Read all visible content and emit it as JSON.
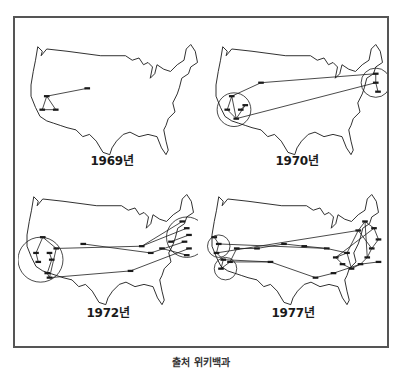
{
  "figure": {
    "frame_color": "#555555",
    "line_color": "#1a1a1a",
    "panels": [
      {
        "year_label": "1969년",
        "circles": [],
        "nodes": [
          [
            22,
            50
          ],
          [
            58,
            43
          ],
          [
            18,
            62
          ],
          [
            30,
            62
          ]
        ],
        "links": [
          [
            0,
            1
          ],
          [
            0,
            2
          ],
          [
            0,
            3
          ],
          [
            2,
            3
          ]
        ]
      },
      {
        "year_label": "1970년",
        "circles": [
          [
            24,
            62,
            15
          ],
          [
            150,
            38,
            13
          ]
        ],
        "nodes": [
          [
            22,
            50
          ],
          [
            48,
            38
          ],
          [
            18,
            62
          ],
          [
            30,
            62
          ],
          [
            26,
            70
          ],
          [
            34,
            58
          ],
          [
            150,
            30
          ],
          [
            150,
            38
          ],
          [
            152,
            46
          ]
        ],
        "links": [
          [
            0,
            2
          ],
          [
            0,
            4
          ],
          [
            2,
            4
          ],
          [
            3,
            5
          ],
          [
            0,
            1
          ],
          [
            1,
            6
          ],
          [
            4,
            7
          ],
          [
            6,
            7
          ],
          [
            7,
            8
          ],
          [
            5,
            4
          ]
        ]
      },
      {
        "year_label": "1972년",
        "circles": [
          [
            20,
            62,
            20
          ],
          [
            150,
            42,
            18
          ]
        ],
        "nodes": [
          [
            22,
            42
          ],
          [
            58,
            48
          ],
          [
            110,
            50
          ],
          [
            118,
            56
          ],
          [
            16,
            56
          ],
          [
            18,
            64
          ],
          [
            28,
            56
          ],
          [
            30,
            62
          ],
          [
            26,
            74
          ],
          [
            28,
            78
          ],
          [
            34,
            52
          ],
          [
            100,
            72
          ],
          [
            146,
            28
          ],
          [
            150,
            34
          ],
          [
            152,
            40
          ],
          [
            148,
            46
          ],
          [
            152,
            52
          ],
          [
            150,
            58
          ],
          [
            136,
            46
          ],
          [
            128,
            52
          ]
        ],
        "links": [
          [
            0,
            10
          ],
          [
            10,
            9
          ],
          [
            10,
            2
          ],
          [
            2,
            13
          ],
          [
            1,
            3
          ],
          [
            3,
            15
          ],
          [
            9,
            11
          ],
          [
            11,
            16
          ],
          [
            2,
            12
          ],
          [
            4,
            5
          ],
          [
            6,
            7
          ],
          [
            7,
            8
          ],
          [
            8,
            9
          ],
          [
            18,
            14
          ],
          [
            19,
            17
          ],
          [
            0,
            4
          ]
        ]
      },
      {
        "year_label": "1977년",
        "circles": [
          [
            14,
            50,
            10
          ],
          [
            20,
            70,
            10
          ]
        ],
        "nodes": [
          [
            10,
            42
          ],
          [
            14,
            48
          ],
          [
            12,
            56
          ],
          [
            18,
            62
          ],
          [
            16,
            70
          ],
          [
            24,
            64
          ],
          [
            30,
            52
          ],
          [
            48,
            52
          ],
          [
            72,
            48
          ],
          [
            90,
            50
          ],
          [
            110,
            52
          ],
          [
            128,
            56
          ],
          [
            138,
            36
          ],
          [
            144,
            28
          ],
          [
            152,
            34
          ],
          [
            156,
            44
          ],
          [
            150,
            52
          ],
          [
            146,
            60
          ],
          [
            140,
            66
          ],
          [
            132,
            70
          ],
          [
            124,
            66
          ],
          [
            118,
            60
          ],
          [
            116,
            74
          ],
          [
            100,
            78
          ],
          [
            60,
            64
          ],
          [
            156,
            64
          ]
        ],
        "links": [
          [
            0,
            1
          ],
          [
            1,
            2
          ],
          [
            2,
            3
          ],
          [
            3,
            4
          ],
          [
            4,
            5
          ],
          [
            5,
            6
          ],
          [
            6,
            7
          ],
          [
            7,
            8
          ],
          [
            8,
            9
          ],
          [
            9,
            10
          ],
          [
            10,
            11
          ],
          [
            11,
            12
          ],
          [
            12,
            13
          ],
          [
            13,
            14
          ],
          [
            14,
            15
          ],
          [
            15,
            16
          ],
          [
            16,
            17
          ],
          [
            17,
            18
          ],
          [
            18,
            19
          ],
          [
            19,
            20
          ],
          [
            20,
            21
          ],
          [
            21,
            11
          ],
          [
            22,
            23
          ],
          [
            23,
            24
          ],
          [
            24,
            3
          ],
          [
            1,
            10
          ],
          [
            2,
            12
          ],
          [
            12,
            16
          ],
          [
            13,
            17
          ],
          [
            11,
            19
          ],
          [
            21,
            14
          ],
          [
            22,
            18
          ],
          [
            25,
            18
          ],
          [
            5,
            24
          ]
        ]
      }
    ],
    "caption": "출처 위키백과"
  }
}
